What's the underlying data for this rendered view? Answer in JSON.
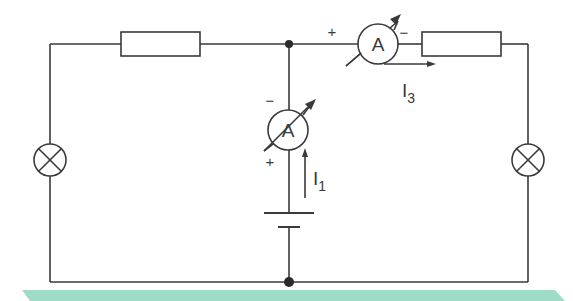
{
  "diagram": {
    "type": "electric-circuit",
    "colors": {
      "wire": "#3a3a3a",
      "footer_band": "#9fdcc8",
      "background": "#ffffff"
    },
    "components": {
      "resistor_left": {
        "label": ""
      },
      "resistor_right": {
        "label": ""
      },
      "lamp_left": {
        "symbol": "lamp-cross"
      },
      "lamp_right": {
        "symbol": "lamp-cross"
      },
      "ammeter_top": {
        "letter": "A",
        "plus": "+",
        "minus": "−"
      },
      "ammeter_middle": {
        "letter": "A",
        "plus": "+",
        "minus": "−"
      },
      "battery": {
        "symbol": "cell"
      }
    },
    "currents": {
      "i1": {
        "base": "I",
        "sub": "1"
      },
      "i3": {
        "base": "I",
        "sub": "3"
      }
    }
  }
}
